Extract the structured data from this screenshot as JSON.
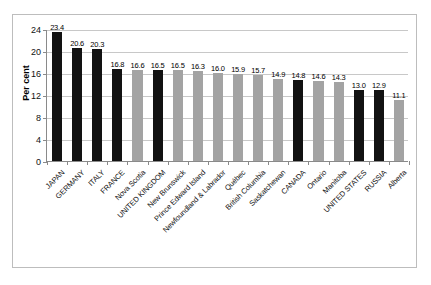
{
  "chart_data": {
    "type": "bar",
    "title": "",
    "xlabel": "",
    "ylabel": "Per cent",
    "ylim": [
      0,
      24
    ],
    "ytick_labels": [
      "0",
      "4",
      "8",
      "12",
      "16",
      "20",
      "24"
    ],
    "yticks": [
      0,
      4,
      8,
      12,
      16,
      20,
      24
    ],
    "grid": true,
    "legend": "none",
    "categories": [
      "JAPAN",
      "GERMANY",
      "ITALY",
      "FRANCE",
      "Nova Scotia",
      "UNITED KINGDOM",
      "New Brunswick",
      "Prince Edward Island",
      "Newfoundland & Labrador",
      "Québec",
      "British Columbia",
      "Saskatchewan",
      "CANADA",
      "Ontario",
      "Manitoba",
      "UNITED STATES",
      "RUSSIA",
      "Alberta"
    ],
    "values": [
      23.4,
      20.6,
      20.3,
      16.8,
      16.6,
      16.5,
      16.5,
      16.3,
      16.0,
      15.9,
      15.7,
      14.9,
      14.8,
      14.6,
      14.3,
      13.0,
      12.9,
      11.1
    ],
    "value_labels": [
      "23.4",
      "20.6",
      "20.3",
      "16.8",
      "16.6",
      "16.5",
      "16.5",
      "16.3",
      "16.0",
      "15.9",
      "15.7",
      "14.9",
      "14.8",
      "14.6",
      "14.3",
      "13.0",
      "12.9",
      "11.1"
    ],
    "bar_colors": [
      "dark",
      "dark",
      "dark",
      "dark",
      "light",
      "dark",
      "light",
      "light",
      "light",
      "light",
      "light",
      "light",
      "dark",
      "light",
      "light",
      "dark",
      "dark",
      "light"
    ],
    "colors": {
      "dark": "#121212",
      "light": "#a3a3a3",
      "gridline": "#c8c8c8",
      "axis": "#8a8a8a",
      "frame": "#bdbdbd",
      "text": "#111111",
      "background": "#ffffff"
    }
  }
}
